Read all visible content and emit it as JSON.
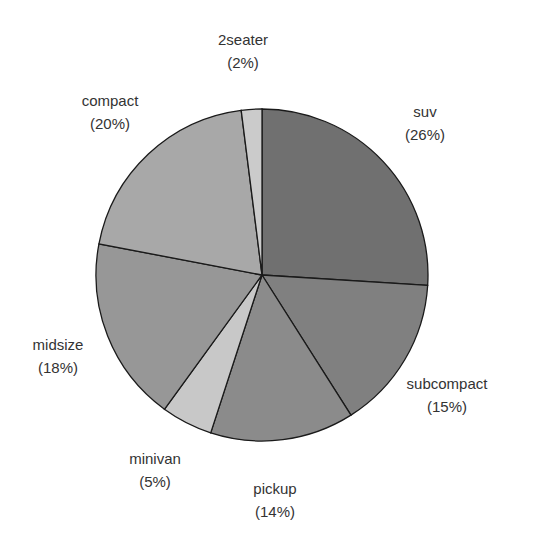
{
  "chart_data": {
    "type": "pie",
    "title": "",
    "categories": [
      "suv",
      "subcompact",
      "pickup",
      "minivan",
      "midsize",
      "compact",
      "2seater"
    ],
    "values": [
      26,
      15,
      14,
      5,
      18,
      20,
      2
    ],
    "labels": [
      "suv\n(26%)",
      "subcompact\n(15%)",
      "pickup\n(14%)",
      "minivan\n(5%)",
      "midsize\n(18%)",
      "compact\n(20%)",
      "2seater\n(2%)"
    ],
    "start_angle": "12 o'clock",
    "direction": "clockwise",
    "colors": [
      "#707070",
      "#808080",
      "#8b8b8b",
      "#c8c8c8",
      "#979797",
      "#a8a8a8",
      "#cbcbcb"
    ],
    "legend": "none"
  },
  "slices": [
    {
      "name": "suv",
      "pct": "(26%)",
      "lx": 425,
      "ly": 100
    },
    {
      "name": "subcompact",
      "pct": "(15%)",
      "lx": 447,
      "ly": 372
    },
    {
      "name": "pickup",
      "pct": "(14%)",
      "lx": 275,
      "ly": 477
    },
    {
      "name": "minivan",
      "pct": "(5%)",
      "lx": 155,
      "ly": 447
    },
    {
      "name": "midsize",
      "pct": "(18%)",
      "lx": 58,
      "ly": 333
    },
    {
      "name": "compact",
      "pct": "(20%)",
      "lx": 110,
      "ly": 89
    },
    {
      "name": "2seater",
      "pct": "(2%)",
      "lx": 243,
      "ly": 28
    }
  ]
}
